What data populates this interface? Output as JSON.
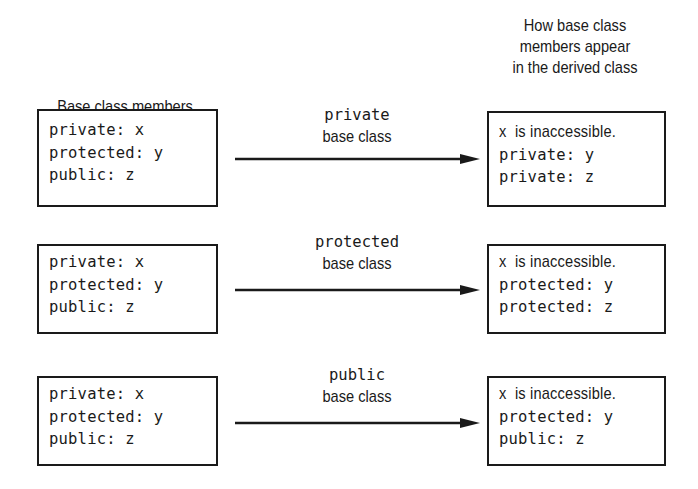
{
  "headers": {
    "left": "Base class members",
    "right": [
      "How base class",
      "members appear",
      "in the derived class"
    ]
  },
  "rows": [
    {
      "base_members": [
        "private: x",
        "protected: y",
        "public: z"
      ],
      "arrow_label_keyword": "private",
      "arrow_label_text": "base class",
      "derived_members": [
        "x  is inaccessible.",
        "private: y",
        "private: z"
      ]
    },
    {
      "base_members": [
        "private: x",
        "protected: y",
        "public: z"
      ],
      "arrow_label_keyword": "protected",
      "arrow_label_text": "base class",
      "derived_members": [
        "x  is inaccessible.",
        "protected: y",
        "protected: z"
      ]
    },
    {
      "base_members": [
        "private: x",
        "protected: y",
        "public: z"
      ],
      "arrow_label_keyword": "public",
      "arrow_label_text": "base class",
      "derived_members": [
        "x  is inaccessible.",
        "protected: y",
        "public: z"
      ]
    }
  ],
  "colors": {
    "stroke": "#1a1a1a",
    "background": "#ffffff"
  }
}
